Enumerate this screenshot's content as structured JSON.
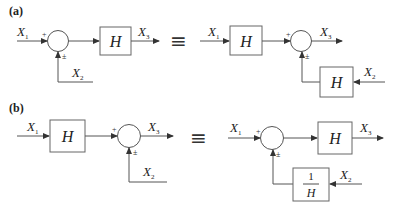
{
  "figure": {
    "panels": [
      {
        "id": "a",
        "label": "(a)",
        "equivalence_symbol": "≡",
        "left": {
          "input1": {
            "var": "X",
            "sub": "1"
          },
          "input2": {
            "var": "X",
            "sub": "2"
          },
          "output": {
            "var": "X",
            "sub": "3"
          },
          "plus_sign": "+",
          "pm_sign": "±",
          "block": "H"
        },
        "right": {
          "input1": {
            "var": "X",
            "sub": "1"
          },
          "input2": {
            "var": "X",
            "sub": "2"
          },
          "output": {
            "var": "X",
            "sub": "3"
          },
          "plus_sign": "+",
          "pm_sign": "±",
          "block_forward": "H",
          "block_feedback": "H"
        }
      },
      {
        "id": "b",
        "label": "(b)",
        "equivalence_symbol": "≡",
        "left": {
          "input1": {
            "var": "X",
            "sub": "1"
          },
          "input2": {
            "var": "X",
            "sub": "2"
          },
          "output": {
            "var": "X",
            "sub": "3"
          },
          "plus_sign": "+",
          "pm_sign": "±",
          "block": "H"
        },
        "right": {
          "input1": {
            "var": "X",
            "sub": "1"
          },
          "input2": {
            "var": "X",
            "sub": "2"
          },
          "output": {
            "var": "X",
            "sub": "3"
          },
          "plus_sign": "+",
          "pm_sign": "±",
          "block_forward": "H",
          "block_feedback": {
            "numerator": "1",
            "denominator": "H"
          }
        }
      }
    ]
  }
}
